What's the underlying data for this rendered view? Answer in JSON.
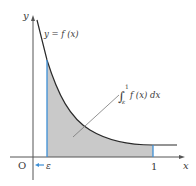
{
  "figure": {
    "axis_labels": {
      "x": "x",
      "y": "y",
      "origin": "O"
    },
    "curve_label": "y = f (x)",
    "integral_label": {
      "symbol": "∫",
      "upper": "1",
      "lower": "ε",
      "integrand": "f (x) dx"
    },
    "x_ticks": {
      "epsilon": "ε",
      "one": "1"
    },
    "arrow_label": "←",
    "colors": {
      "axis": "#555555",
      "curve": "#2a2a2a",
      "shade": "#c9c9c9",
      "bounds": "#3d8fd6",
      "leader": "#777777"
    }
  }
}
